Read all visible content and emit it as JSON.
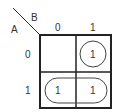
{
  "kmap": {
    "row_variable": "A",
    "col_variable": "B",
    "col_headers": [
      "0",
      "1"
    ],
    "row_headers": [
      "0",
      "1"
    ],
    "cells": [
      [
        "",
        "1"
      ],
      [
        "1",
        "1"
      ]
    ],
    "groupings": [
      {
        "type": "circle",
        "cells": [
          [
            0,
            1
          ]
        ]
      },
      {
        "type": "pill",
        "cells": [
          [
            1,
            0
          ],
          [
            1,
            1
          ]
        ]
      }
    ],
    "line_color": "#222222"
  }
}
